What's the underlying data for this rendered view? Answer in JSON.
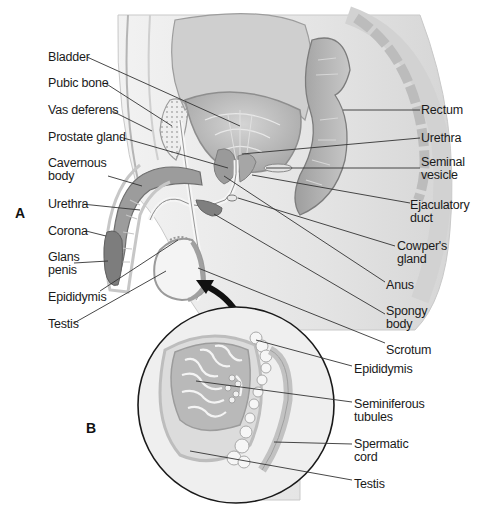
{
  "figure": {
    "panel_a": "A",
    "panel_b": "B"
  },
  "labels_left": {
    "bladder": "Bladder",
    "pubic_bone": "Pubic bone",
    "vas_deferens": "Vas deferens",
    "prostate_gland": "Prostate gland",
    "cavernous_body": [
      "Cavernous",
      "body"
    ],
    "urethra": "Urethra",
    "corona": "Corona",
    "glans_penis": [
      "Glans",
      "penis"
    ],
    "epididymis": "Epididymis",
    "testis": "Testis"
  },
  "labels_right": {
    "rectum": "Rectum",
    "urethra": "Urethra",
    "seminal_vesicle": [
      "Seminal",
      "vesicle"
    ],
    "ejaculatory_duct": [
      "Ejaculatory",
      "duct"
    ],
    "cowpers_gland": [
      "Cowper's",
      "gland"
    ],
    "anus": "Anus",
    "spongy_body": [
      "Spongy",
      "body"
    ],
    "scrotum": "Scrotum"
  },
  "labels_inset": {
    "epididymis": "Epididymis",
    "seminiferous_tubules": [
      "Seminiferous",
      "tubules"
    ],
    "spermatic_cord": [
      "Spermatic",
      "cord"
    ],
    "testis": "Testis"
  },
  "colors": {
    "background": "#ffffff",
    "tissue_light": "#e6e6e6",
    "tissue_mid": "#bdbdbd",
    "tissue_dark": "#8c8c8c",
    "outline": "#9a9a9a",
    "leader_line": "#333333",
    "arrow": "#111111"
  }
}
